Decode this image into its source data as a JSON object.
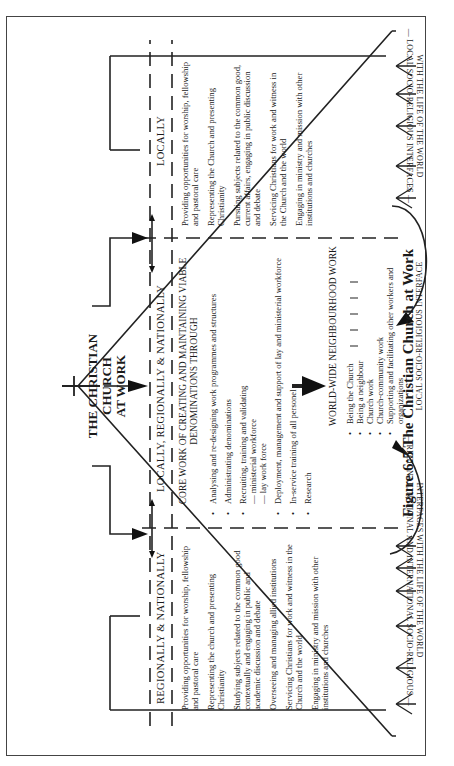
{
  "caption": "Figure 6:5  The Christian Church at Work",
  "title": {
    "line1": "THE CHRISTIAN CHURCH",
    "line2": "AT WORK"
  },
  "levels": {
    "left": "REGIONALLY & NATIONALLY",
    "center": "LOCALLY, REGIONALLY & NATIONALLY",
    "right": "LOCALLY"
  },
  "regional_column": {
    "items": [
      "Providing opportunities for worship, fellowship and pastoral care",
      "Representing the church and presenting Christianity",
      "Studying subjects related to the common good contextually and engaging in public and academic discussion and debate",
      "Overseeing and managing allied institutions",
      "Servicing Christians for work and witness in the Church and the world",
      "Engaging in ministry and mission with other institutions and churches"
    ]
  },
  "core_column": {
    "heading": "CORE WORK OF CREATING AND MAINTAINING VIABLE DENOMINATIONS THROUGH",
    "items": [
      "Analysing and re-designing work programmes and structures",
      "Administrating denominations",
      "Recruiting, training and validating",
      "— ministerial workforce",
      "— lay work force",
      "Deployment, management and support of lay and ministerial workforce",
      "In-service training of all personel",
      "Research"
    ]
  },
  "local_column": {
    "items": [
      "Providing opportunities for worship, fellowship and pastoral care",
      "Representing the Church and presenting Christianity",
      "Pursuing subjects related to the common good, current affairs, engaging in public discussion and debate",
      "Servicing Christians for work and witness in the Church and the world",
      "Engaging in ministry and mission with other institutions and churches"
    ]
  },
  "worldwide": {
    "heading": "WORLD-WIDE NEIGHBOURHOOD WORK",
    "items": [
      "Being the Church",
      "Being a neighbour",
      "Church work",
      "Church-community work",
      "Supporting and facilitating other workers and organizations"
    ],
    "interface": "LOCAL SOCIO-RELIGIOUS INTERFACE"
  },
  "interfaces": {
    "left_line1": "— REGIONAL, NATIONAL AND INTERNATIONAL SOCIO-RELIGIOUS —",
    "left_line2": "INTERFACES WITH THE LIFE OF THE WORLD",
    "right_line1": "— LOCAL SOCIO-RELIGIOUS INTERFACES —",
    "right_line2": "WITH THE LIFE OF THE WORLD"
  }
}
